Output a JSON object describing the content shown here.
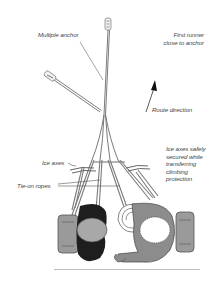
{
  "diagram": {
    "labels": {
      "multiple_anchor": "Multiple anchor",
      "first_runner": [
        "First runner",
        "close to anchor"
      ],
      "route_direction": "Route direction",
      "ice_axes": "Ice axes",
      "tie_on_ropes": "Tie-on ropes",
      "ice_axes_secured": [
        "Ice axes safely",
        "secured while",
        "transferring",
        "climbing",
        "protection"
      ]
    },
    "colors": {
      "background": "#ffffff",
      "line": "#777777",
      "text": "#444444",
      "climber_dark": "#1e1e1e",
      "climber_grey": "#8c8c8c",
      "helmet": "#a8a8a8",
      "pack": "#9a9a9a",
      "rule": "#bdbdbd"
    }
  }
}
